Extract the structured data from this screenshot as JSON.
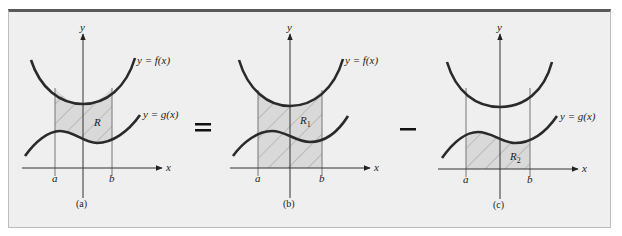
{
  "figure": {
    "operators": [
      "=",
      "−"
    ],
    "panels": [
      {
        "id": "a",
        "caption": "(a)",
        "axis_x_label": "x",
        "axis_y_label": "y",
        "tick_a": "a",
        "tick_b": "b",
        "upper_curve_label": "y = f(x)",
        "lower_curve_label": "y = g(x)",
        "region_label": "R",
        "region_sub": "",
        "shaded": "between f and g on [a, b]"
      },
      {
        "id": "b",
        "caption": "(b)",
        "axis_x_label": "x",
        "axis_y_label": "y",
        "tick_a": "a",
        "tick_b": "b",
        "upper_curve_label": "y = f(x)",
        "lower_curve_label": "",
        "region_label": "R",
        "region_sub": "1",
        "shaded": "between f and x-axis on [a, b]"
      },
      {
        "id": "c",
        "caption": "(c)",
        "axis_x_label": "x",
        "axis_y_label": "y",
        "tick_a": "a",
        "tick_b": "b",
        "upper_curve_label": "",
        "lower_curve_label": "y = g(x)",
        "region_label": "R",
        "region_sub": "2",
        "shaded": "between g and x-axis on [a, b]"
      }
    ],
    "colors": {
      "background": "#efefef",
      "border_top": "#5a5a5a",
      "curve": "#2a2a2a",
      "region_fill": "#d9d9d9",
      "hatch": "#9a9a9a",
      "axis": "#333333"
    }
  }
}
